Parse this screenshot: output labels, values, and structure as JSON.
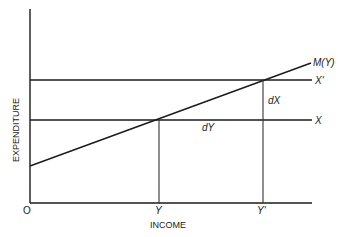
{
  "diagram": {
    "axes": {
      "x_label": "INCOME",
      "y_label": "EXPENDITURE",
      "origin_label": "O"
    },
    "lines": {
      "m_curve_label": "M(Y)",
      "x_prime_label": "X'",
      "x_label": "X"
    },
    "ticks": {
      "y_label": "Y",
      "y_prime_label": "Y'"
    },
    "annotations": {
      "dx_label": "dX",
      "dy_label": "dY"
    },
    "colors": {
      "ink": "#1a1a1a",
      "background": "#ffffff"
    }
  }
}
